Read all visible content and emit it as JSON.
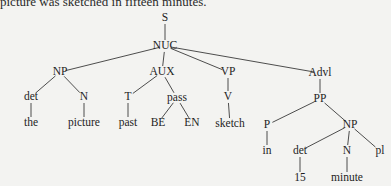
{
  "caption": "picture was sketched in fifteen minutes.",
  "tree": {
    "nodes": [
      {
        "id": "S",
        "label": "S",
        "x": 165,
        "y": 18
      },
      {
        "id": "NUC",
        "label": "NUC",
        "x": 165,
        "y": 46
      },
      {
        "id": "NP1",
        "label": "NP",
        "x": 60,
        "y": 72
      },
      {
        "id": "AUX",
        "label": "AUX",
        "x": 162,
        "y": 72
      },
      {
        "id": "VP",
        "label": "VP",
        "x": 228,
        "y": 72
      },
      {
        "id": "Advl",
        "label": "Advl",
        "x": 320,
        "y": 73
      },
      {
        "id": "det1",
        "label": "det",
        "x": 31,
        "y": 97
      },
      {
        "id": "N1",
        "label": "N",
        "x": 84,
        "y": 97
      },
      {
        "id": "T",
        "label": "T",
        "x": 128,
        "y": 97
      },
      {
        "id": "pass",
        "label": "pass",
        "x": 177,
        "y": 98
      },
      {
        "id": "V",
        "label": "V",
        "x": 228,
        "y": 97
      },
      {
        "id": "PP",
        "label": "PP",
        "x": 320,
        "y": 99
      },
      {
        "id": "the",
        "label": "the",
        "x": 31,
        "y": 123
      },
      {
        "id": "picture",
        "label": "picture",
        "x": 84,
        "y": 123
      },
      {
        "id": "past",
        "label": "past",
        "x": 128,
        "y": 123
      },
      {
        "id": "BE",
        "label": "BE",
        "x": 158,
        "y": 123
      },
      {
        "id": "EN",
        "label": "EN",
        "x": 192,
        "y": 123
      },
      {
        "id": "sketch",
        "label": "sketch",
        "x": 230,
        "y": 124
      },
      {
        "id": "P",
        "label": "P",
        "x": 267,
        "y": 125
      },
      {
        "id": "NP2",
        "label": "NP",
        "x": 350,
        "y": 125
      },
      {
        "id": "in",
        "label": "in",
        "x": 267,
        "y": 151
      },
      {
        "id": "det2",
        "label": "det",
        "x": 300,
        "y": 151
      },
      {
        "id": "N2",
        "label": "N",
        "x": 347,
        "y": 151
      },
      {
        "id": "pl",
        "label": "pl",
        "x": 380,
        "y": 151
      },
      {
        "id": "15",
        "label": "15",
        "x": 300,
        "y": 178
      },
      {
        "id": "minute",
        "label": "minute",
        "x": 347,
        "y": 178
      }
    ],
    "edges": [
      [
        "S",
        "NUC"
      ],
      [
        "NUC",
        "NP1"
      ],
      [
        "NUC",
        "AUX"
      ],
      [
        "NUC",
        "VP"
      ],
      [
        "NUC",
        "Advl"
      ],
      [
        "NP1",
        "det1"
      ],
      [
        "NP1",
        "N1"
      ],
      [
        "AUX",
        "T"
      ],
      [
        "AUX",
        "pass"
      ],
      [
        "VP",
        "V"
      ],
      [
        "Advl",
        "PP"
      ],
      [
        "det1",
        "the"
      ],
      [
        "N1",
        "picture"
      ],
      [
        "T",
        "past"
      ],
      [
        "pass",
        "BE"
      ],
      [
        "pass",
        "EN"
      ],
      [
        "V",
        "sketch"
      ],
      [
        "PP",
        "P"
      ],
      [
        "PP",
        "NP2"
      ],
      [
        "P",
        "in"
      ],
      [
        "NP2",
        "det2"
      ],
      [
        "NP2",
        "N2"
      ],
      [
        "NP2",
        "pl"
      ],
      [
        "det2",
        "15"
      ],
      [
        "N2",
        "minute"
      ]
    ]
  }
}
